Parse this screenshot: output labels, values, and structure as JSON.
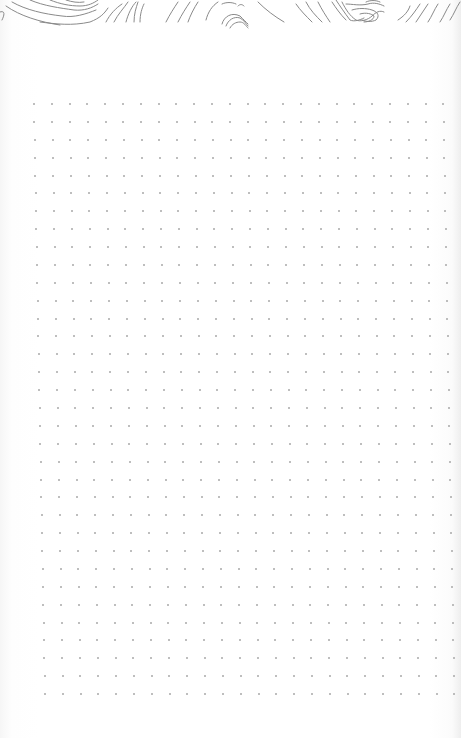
{
  "page": {
    "type": "dot-grid-notebook-page",
    "background_color": "#ffffff",
    "dot_color": "#a8a8a8",
    "contour_color": "#8a8a8a"
  },
  "header_decoration": {
    "style": "topographic-contour-lines",
    "height_px": 28
  },
  "dot_grid": {
    "columns": 24,
    "rows": 34,
    "top_row_y": 104,
    "bottom_row_y": 694,
    "top_left_x": 34,
    "bottom_left_x": 45,
    "spacing_x": 17.8,
    "spacing_y": 17.9
  }
}
